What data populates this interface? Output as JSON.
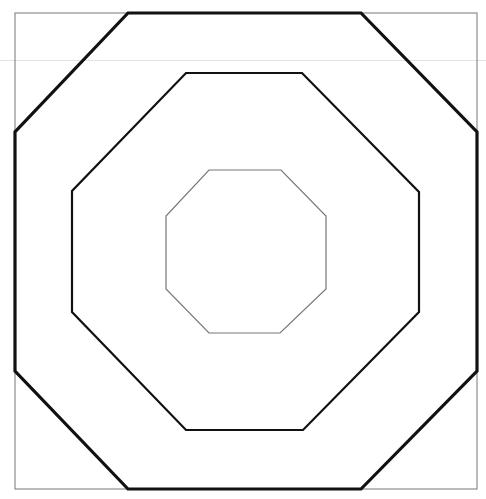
{
  "canvas": {
    "width": 486,
    "height": 499,
    "background": "#ffffff"
  },
  "colors": {
    "stroke": "#111111",
    "frame": "#777777",
    "inner": "#777777",
    "artifact": "#e2e2e2"
  },
  "frame": {
    "x": 15,
    "y": 13,
    "width": 462,
    "height": 476
  },
  "artifact_line": {
    "y": 60.5
  },
  "octagons": [
    {
      "name": "outer",
      "points": "128,13 361,13 477,132 477,371 361,489 128,489 15,371 15,132",
      "stroke_width": 3.2
    },
    {
      "name": "middle",
      "points": "186,73 302,73 419,192 419,312 303,430 186,430 72,312 72,191",
      "stroke_width": 2.2
    },
    {
      "name": "inner",
      "points": "209,170 281,170 326,216 326,289 280,333 209,333 166,289 166,216",
      "stroke_width": 1.2
    }
  ]
}
